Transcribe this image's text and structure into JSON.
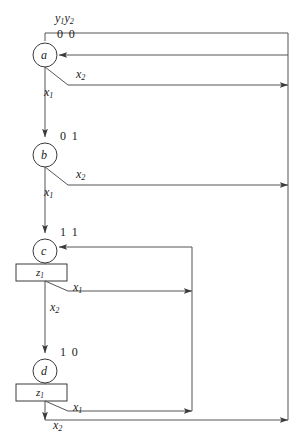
{
  "diagram": {
    "type": "state-flow-chart",
    "title_label": "y1y2",
    "header": {
      "var_label_y1": "y",
      "var_label_y1_sub": "1",
      "var_label_y2": "y",
      "var_label_y2_sub": "2"
    },
    "stroke_color": "#555555",
    "text_color": "#1a1a1a",
    "states": [
      {
        "id": "a",
        "name": "a",
        "encoding": "0 0",
        "cx": 45,
        "cy": 55,
        "r": 12,
        "output": null
      },
      {
        "id": "b",
        "name": "b",
        "encoding": "0 1",
        "cx": 45,
        "cy": 155,
        "r": 12,
        "output": null
      },
      {
        "id": "c",
        "name": "c",
        "encoding": "1 1",
        "cx": 45,
        "cy": 251,
        "r": 12,
        "output": "z1"
      },
      {
        "id": "d",
        "name": "d",
        "encoding": "1 0",
        "cx": 45,
        "cy": 371,
        "r": 12,
        "output": "z1"
      }
    ],
    "outputs": [
      {
        "state": "c",
        "label": "z",
        "sub": "1",
        "x": 16,
        "y": 264,
        "w": 51,
        "h": 17
      },
      {
        "state": "d",
        "label": "z",
        "sub": "1",
        "x": 16,
        "y": 384,
        "w": 51,
        "h": 17
      }
    ],
    "branches": [
      {
        "from": "a",
        "condition": "x",
        "sub": "1",
        "label_x": 44,
        "label_y": 90,
        "target": "b"
      },
      {
        "from": "a",
        "condition": "x",
        "sub": "2",
        "label_x": 76,
        "label_y": 72,
        "target": "a"
      },
      {
        "from": "b",
        "condition": "x",
        "sub": "1",
        "label_x": 44,
        "label_y": 188,
        "target": "c"
      },
      {
        "from": "b",
        "condition": "x",
        "sub": "2",
        "label_x": 76,
        "label_y": 170,
        "target": "a"
      },
      {
        "from": "c",
        "condition": "x",
        "sub": "1",
        "label_x": 74,
        "label_y": 285,
        "target": "c"
      },
      {
        "from": "c",
        "condition": "x",
        "sub": "2",
        "label_x": 51,
        "label_y": 305,
        "target": "d"
      },
      {
        "from": "d",
        "condition": "x",
        "sub": "1",
        "label_x": 74,
        "label_y": 405,
        "target": "c"
      },
      {
        "from": "d",
        "condition": "x",
        "sub": "2",
        "label_x": 48,
        "label_y": 423,
        "target": "a"
      }
    ],
    "state_labels": {
      "a_bits": "0 0",
      "b_bits": "0 1",
      "c_bits": "1 1",
      "d_bits": "1 0"
    },
    "x_labels": {
      "x": "x",
      "sub1": "1",
      "sub2": "2"
    },
    "z_labels": {
      "z": "z",
      "sub1": "1"
    }
  }
}
